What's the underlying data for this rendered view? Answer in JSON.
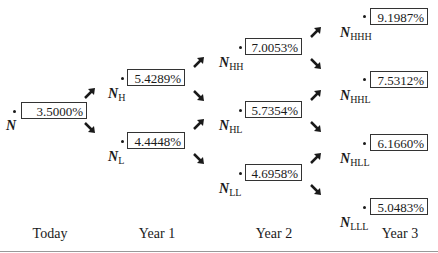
{
  "nodes": {
    "n": {
      "symbol": "N",
      "sub": "",
      "value": "3.5000%"
    },
    "h": {
      "symbol": "N",
      "sub": "H",
      "value": "5.4289%"
    },
    "l": {
      "symbol": "N",
      "sub": "L",
      "value": "4.4448%"
    },
    "hh": {
      "symbol": "N",
      "sub": "HH",
      "value": "7.0053%"
    },
    "hl": {
      "symbol": "N",
      "sub": "HL",
      "value": "5.7354%"
    },
    "ll": {
      "symbol": "N",
      "sub": "LL",
      "value": "4.6958%"
    },
    "hhh": {
      "symbol": "N",
      "sub": "HHH",
      "value": "9.1987%"
    },
    "hhl": {
      "symbol": "N",
      "sub": "HHL",
      "value": "7.5312%"
    },
    "hll": {
      "symbol": "N",
      "sub": "HLL",
      "value": "6.1660%"
    },
    "lll": {
      "symbol": "N",
      "sub": "LLL",
      "value": "5.0483%"
    }
  },
  "periods": [
    "Today",
    "Year 1",
    "Year 2",
    "Year 3"
  ],
  "icons": {
    "up": "arrow-up-right-icon",
    "down": "arrow-down-right-icon"
  }
}
